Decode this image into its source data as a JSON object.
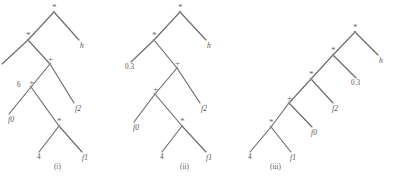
{
  "figure": {
    "background_color": "#ffffff",
    "edge_color": "#6b6b6b",
    "node_color": "#8a8a8a",
    "text_color": "#555252"
  },
  "trees": [
    {
      "id": "tree-i",
      "caption": "(i)",
      "caption_pos": {
        "x": 54,
        "y": 163
      },
      "nodes": [
        {
          "name": "root-times",
          "label": "*",
          "kind": "op",
          "x": 54,
          "y": 12,
          "label_dx": -2,
          "label_dy": -9
        },
        {
          "name": "times-inner",
          "label": "*",
          "kind": "op",
          "x": 28,
          "y": 40,
          "label_dx": -2,
          "label_dy": -9
        },
        {
          "name": "leaf-h",
          "label": "h",
          "kind": "fn",
          "x": 79,
          "y": 40,
          "label_dx": 1,
          "label_dy": 2
        },
        {
          "name": "leaf-const",
          "label": "6",
          "kind": "num",
          "x": 2,
          "y": 64,
          "label_dx": 15,
          "label_dy": 18
        },
        {
          "name": "plus-outer",
          "label": "+",
          "kind": "op",
          "x": 50,
          "y": 64,
          "label_dx": -2,
          "label_dy": -9
        },
        {
          "name": "plus-inner",
          "label": "+",
          "kind": "op",
          "x": 31,
          "y": 87,
          "label_dx": -2,
          "label_dy": -9
        },
        {
          "name": "leaf-f2",
          "label": "f2",
          "kind": "fn",
          "x": 74,
          "y": 103,
          "label_dx": 1,
          "label_dy": 2
        },
        {
          "name": "leaf-f0",
          "label": "f0",
          "kind": "fn",
          "x": 9,
          "y": 114,
          "label_dx": -1,
          "label_dy": 2
        },
        {
          "name": "times-leaf",
          "label": "*",
          "kind": "op",
          "x": 59,
          "y": 126,
          "label_dx": -2,
          "label_dy": -9
        },
        {
          "name": "leaf-4",
          "label": "4",
          "kind": "num",
          "x": 39,
          "y": 152,
          "label_dx": -2,
          "label_dy": 2
        },
        {
          "name": "leaf-f1",
          "label": "f1",
          "kind": "fn",
          "x": 82,
          "y": 152,
          "label_dx": 0,
          "label_dy": 2
        }
      ],
      "edges": [
        [
          "root-times",
          "times-inner"
        ],
        [
          "root-times",
          "leaf-h"
        ],
        [
          "times-inner",
          "leaf-const"
        ],
        [
          "times-inner",
          "plus-outer"
        ],
        [
          "plus-outer",
          "plus-inner"
        ],
        [
          "plus-outer",
          "leaf-f2"
        ],
        [
          "plus-inner",
          "leaf-f0"
        ],
        [
          "plus-inner",
          "times-leaf"
        ],
        [
          "times-leaf",
          "leaf-4"
        ],
        [
          "times-leaf",
          "leaf-f1"
        ]
      ]
    },
    {
      "id": "tree-ii",
      "caption": "(ii)",
      "caption_pos": {
        "x": 180,
        "y": 163
      },
      "nodes": [
        {
          "name": "root-times",
          "label": "*",
          "kind": "op",
          "x": 180,
          "y": 12,
          "label_dx": -2,
          "label_dy": -9
        },
        {
          "name": "times-inner",
          "label": "*",
          "kind": "op",
          "x": 154,
          "y": 40,
          "label_dx": -2,
          "label_dy": -9
        },
        {
          "name": "leaf-h",
          "label": "h",
          "kind": "fn",
          "x": 206,
          "y": 40,
          "label_dx": 1,
          "label_dy": 2
        },
        {
          "name": "leaf-const",
          "label": "0.3",
          "kind": "num",
          "x": 131,
          "y": 62,
          "label_dx": -6,
          "label_dy": 2
        },
        {
          "name": "plus-outer",
          "label": "+",
          "kind": "op",
          "x": 177,
          "y": 68,
          "label_dx": -2,
          "label_dy": -9
        },
        {
          "name": "plus-inner",
          "label": "+",
          "kind": "op",
          "x": 155,
          "y": 94,
          "label_dx": -2,
          "label_dy": -9
        },
        {
          "name": "leaf-f2",
          "label": "f2",
          "kind": "fn",
          "x": 200,
          "y": 103,
          "label_dx": 1,
          "label_dy": 2
        },
        {
          "name": "leaf-f0",
          "label": "f0",
          "kind": "fn",
          "x": 134,
          "y": 122,
          "label_dx": -1,
          "label_dy": 2
        },
        {
          "name": "times-leaf",
          "label": "*",
          "kind": "op",
          "x": 182,
          "y": 126,
          "label_dx": -2,
          "label_dy": -9
        },
        {
          "name": "leaf-4",
          "label": "4",
          "kind": "num",
          "x": 162,
          "y": 152,
          "label_dx": -2,
          "label_dy": 2
        },
        {
          "name": "leaf-f1",
          "label": "f1",
          "kind": "fn",
          "x": 206,
          "y": 152,
          "label_dx": 0,
          "label_dy": 2
        }
      ],
      "edges": [
        [
          "root-times",
          "times-inner"
        ],
        [
          "root-times",
          "leaf-h"
        ],
        [
          "times-inner",
          "leaf-const"
        ],
        [
          "times-inner",
          "plus-outer"
        ],
        [
          "plus-outer",
          "plus-inner"
        ],
        [
          "plus-outer",
          "leaf-f2"
        ],
        [
          "plus-inner",
          "leaf-f0"
        ],
        [
          "plus-inner",
          "times-leaf"
        ],
        [
          "times-leaf",
          "leaf-4"
        ],
        [
          "times-leaf",
          "leaf-f1"
        ]
      ]
    },
    {
      "id": "tree-iii",
      "caption": "(iii)",
      "caption_pos": {
        "x": 270,
        "y": 163
      },
      "nodes": [
        {
          "name": "root-times",
          "label": "*",
          "kind": "op",
          "x": 355,
          "y": 32,
          "label_dx": -2,
          "label_dy": -9
        },
        {
          "name": "times-inner",
          "label": "*",
          "kind": "op",
          "x": 333,
          "y": 55,
          "label_dx": -2,
          "label_dy": -9
        },
        {
          "name": "leaf-h",
          "label": "h",
          "kind": "fn",
          "x": 378,
          "y": 55,
          "label_dx": 1,
          "label_dy": 2
        },
        {
          "name": "leaf-const",
          "label": "0.3",
          "kind": "num",
          "x": 356,
          "y": 78,
          "label_dx": -5,
          "label_dy": 2
        },
        {
          "name": "plus-outer",
          "label": "*",
          "kind": "op",
          "x": 311,
          "y": 79,
          "label_dx": -2,
          "label_dy": -9
        },
        {
          "name": "leaf-f2",
          "label": "f2",
          "kind": "fn",
          "x": 333,
          "y": 103,
          "label_dx": -1,
          "label_dy": 2
        },
        {
          "name": "plus-inner",
          "label": "+",
          "kind": "op",
          "x": 289,
          "y": 103,
          "label_dx": -2,
          "label_dy": -9
        },
        {
          "name": "leaf-f0",
          "label": "f0",
          "kind": "fn",
          "x": 312,
          "y": 127,
          "label_dx": -1,
          "label_dy": 2
        },
        {
          "name": "times-leaf",
          "label": "*",
          "kind": "op",
          "x": 271,
          "y": 127,
          "label_dx": -2,
          "label_dy": -9
        },
        {
          "name": "leaf-f1",
          "label": "f1",
          "kind": "fn",
          "x": 291,
          "y": 152,
          "label_dx": -1,
          "label_dy": 2
        },
        {
          "name": "leaf-4",
          "label": "4",
          "kind": "num",
          "x": 250,
          "y": 152,
          "label_dx": -2,
          "label_dy": 2
        }
      ],
      "edges": [
        [
          "root-times",
          "times-inner"
        ],
        [
          "root-times",
          "leaf-h"
        ],
        [
          "times-inner",
          "plus-outer"
        ],
        [
          "times-inner",
          "leaf-const"
        ],
        [
          "plus-outer",
          "plus-inner"
        ],
        [
          "plus-outer",
          "leaf-f2"
        ],
        [
          "plus-inner",
          "times-leaf"
        ],
        [
          "plus-inner",
          "leaf-f0"
        ],
        [
          "times-leaf",
          "leaf-4"
        ],
        [
          "times-leaf",
          "leaf-f1"
        ]
      ]
    }
  ]
}
